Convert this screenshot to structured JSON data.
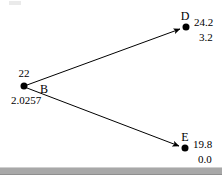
{
  "diagram": {
    "type": "node-link-tree",
    "title": "",
    "background_color": "#ffffff",
    "node_color": "#000000",
    "edge_color": "#000000",
    "ground_bar_color": "#a8a8a8",
    "nodes": [
      {
        "id": "B",
        "name": "B",
        "value_top": "22",
        "value_bottom": "2.0257",
        "x": 24,
        "y": 86,
        "name_x": 44,
        "name_y": 88,
        "value_top_x": 24,
        "value_top_y": 74,
        "value_bottom_x": 26,
        "value_bottom_y": 99
      },
      {
        "id": "D",
        "name": "D",
        "value_top": "24.2",
        "value_bottom": "3.2",
        "x": 186,
        "y": 27,
        "name_x": 184,
        "name_y": 15,
        "value_top_x": 209,
        "value_top_y": 21,
        "value_bottom_x": 209,
        "value_bottom_y": 36
      },
      {
        "id": "E",
        "name": "E",
        "value_top": "19.8",
        "value_bottom": "0.0",
        "x": 185,
        "y": 148,
        "name_x": 184,
        "name_y": 136,
        "value_top_x": 208,
        "value_top_y": 143,
        "value_bottom_x": 208,
        "value_bottom_y": 158
      }
    ],
    "edges": [
      {
        "from": "B",
        "to": "D",
        "arrow": true
      },
      {
        "from": "B",
        "to": "E",
        "arrow": true
      }
    ],
    "ground_bar": {
      "y": 167,
      "height": 6
    }
  }
}
